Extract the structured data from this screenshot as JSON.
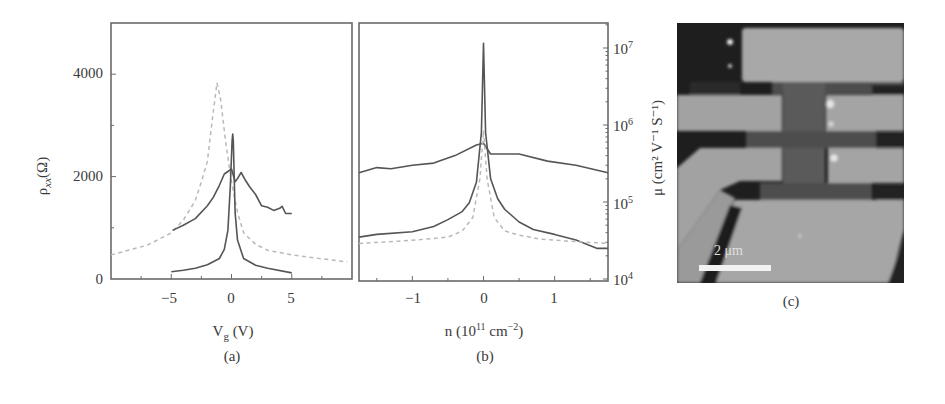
{
  "chart_data": [
    {
      "panel": "a",
      "type": "line",
      "caption": "(a)",
      "xlabel": "V_g (V)",
      "ylabel": "ρ_xx(Ω)",
      "xlim": [
        -10,
        10
      ],
      "ylim": [
        0,
        5000
      ],
      "xticks": [
        "-5",
        "0",
        "5"
      ],
      "yticks": [
        "0",
        "2000",
        "4000"
      ],
      "grid": false,
      "series": [
        {
          "name": "dashed (light gray)",
          "style": "dashed",
          "x": [
            -10,
            -7,
            -5,
            -4,
            -3,
            -2.5,
            -2,
            -1.6,
            -1.2,
            -0.9,
            -0.5,
            0,
            0.5,
            1,
            2,
            3,
            5,
            7,
            9.6
          ],
          "y": [
            470,
            660,
            900,
            1150,
            1530,
            1900,
            2300,
            3100,
            3830,
            3500,
            2700,
            1900,
            1300,
            900,
            680,
            560,
            470,
            410,
            330
          ]
        },
        {
          "name": "solid broad",
          "style": "solid",
          "x": [
            -4.9,
            -4,
            -3,
            -2,
            -1.5,
            -1,
            -0.6,
            -0.3,
            0,
            0.3,
            0.5,
            0.8,
            1.1,
            1.5,
            2,
            2.5,
            3,
            3.5,
            4,
            4.2,
            4.5,
            5
          ],
          "y": [
            950,
            1050,
            1180,
            1430,
            1600,
            1830,
            2050,
            2100,
            2150,
            1900,
            1960,
            2080,
            1950,
            1800,
            1650,
            1430,
            1400,
            1340,
            1380,
            1420,
            1280,
            1280
          ]
        },
        {
          "name": "solid sharp",
          "style": "solid",
          "x": [
            -5,
            -4,
            -3,
            -2,
            -1,
            -0.6,
            -0.3,
            -0.1,
            0.05,
            0.1,
            0.15,
            0.3,
            0.5,
            1,
            2,
            3,
            5
          ],
          "y": [
            140,
            170,
            210,
            280,
            400,
            580,
            950,
            1800,
            2700,
            2830,
            2700,
            1300,
            760,
            400,
            270,
            210,
            120
          ]
        }
      ]
    },
    {
      "panel": "b",
      "type": "line",
      "caption": "(b)",
      "xlabel": "n (10^11 cm^-2)",
      "ylabel": "μ (cm^2 V^-1 S^-1)",
      "yaxis_side": "right",
      "yscale": "log",
      "xlim": [
        -1.75,
        1.75
      ],
      "ylim": [
        10000,
        20000000
      ],
      "xticks": [
        "-1",
        "0",
        "1"
      ],
      "yticks": [
        "10^4",
        "10^5",
        "10^6",
        "10^7"
      ],
      "grid": false,
      "series": [
        {
          "name": "solid broad",
          "style": "solid",
          "x": [
            -1.75,
            -1.5,
            -1.3,
            -1.0,
            -0.7,
            -0.4,
            -0.1,
            0.0,
            0.1,
            0.5,
            0.9,
            1.3,
            1.75
          ],
          "y": [
            240000,
            280000,
            270000,
            300000,
            320000,
            400000,
            550000,
            580000,
            420000,
            420000,
            340000,
            300000,
            240000
          ]
        },
        {
          "name": "solid sharp",
          "style": "solid",
          "x": [
            -1.75,
            -1.5,
            -1.0,
            -0.7,
            -0.5,
            -0.3,
            -0.2,
            -0.1,
            -0.03,
            0.0,
            0.03,
            0.1,
            0.2,
            0.3,
            0.5,
            0.7,
            1.0,
            1.3,
            1.6,
            1.75
          ],
          "y": [
            35000,
            38000,
            41000,
            48000,
            59000,
            75000,
            98000,
            180000,
            800000,
            11500000,
            800000,
            200000,
            110000,
            80000,
            55000,
            44000,
            38000,
            32000,
            25000,
            25000
          ]
        },
        {
          "name": "dashed (light gray)",
          "style": "dashed",
          "x": [
            -1.75,
            -1.2,
            -0.8,
            -0.5,
            -0.3,
            -0.15,
            -0.05,
            0.0,
            0.05,
            0.15,
            0.3,
            0.5,
            0.8,
            1.2,
            1.75
          ],
          "y": [
            29000,
            31000,
            33000,
            35000,
            42000,
            63000,
            200000,
            850000,
            200000,
            63000,
            42000,
            37000,
            33000,
            31000,
            29000
          ]
        }
      ]
    },
    {
      "panel": "c",
      "type": "image",
      "caption": "(c)",
      "description": "Grayscale micrograph of Hall-bar device",
      "scale_bar": "2 μm"
    }
  ],
  "labels": {
    "a": {
      "caption": "(a)",
      "xlabel_main": "V",
      "xlabel_sub": "g",
      "xlabel_unit": " (V)",
      "ylabel_main": "ρ",
      "ylabel_sub": "xx",
      "ylabel_unit": "(Ω)",
      "xticks": [
        "−5",
        "0",
        "5"
      ],
      "yticks": [
        "0",
        "2000",
        "4000"
      ]
    },
    "b": {
      "caption": "(b)",
      "xlabel_pre": "n (10",
      "xlabel_sup": "11",
      "xlabel_mid": " cm",
      "xlabel_sup2": "−2",
      "xlabel_end": ")",
      "ylabel": "μ (cm² V⁻¹ S⁻¹)",
      "xticks": [
        "−1",
        "0",
        "1"
      ],
      "yticks": [
        {
          "base": "10",
          "exp": "4"
        },
        {
          "base": "10",
          "exp": "5"
        },
        {
          "base": "10",
          "exp": "6"
        },
        {
          "base": "10",
          "exp": "7"
        }
      ]
    },
    "c": {
      "caption": "(c)",
      "scale_bar": "2 μm"
    }
  },
  "colors": {
    "solid": "#555555",
    "dashed": "#b9b9b9",
    "axis": "#6a6a6a"
  }
}
